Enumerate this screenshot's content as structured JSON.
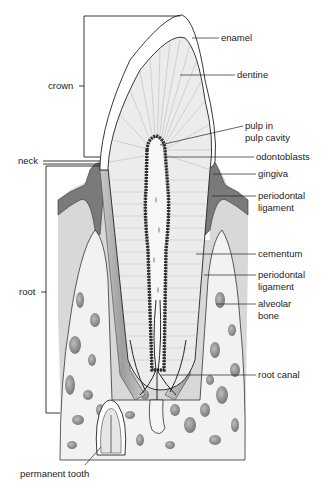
{
  "labels": {
    "enamel": "enamel",
    "dentine": "dentine",
    "pulp_line1": "pulp in",
    "pulp_line2": "pulp cavity",
    "odontoblasts": "odontoblasts",
    "gingiva": "gingiva",
    "pdl_upper_line1": "periodontal",
    "pdl_upper_line2": "ligament",
    "cementum": "cementum",
    "pdl_lower_line1": "periodontal",
    "pdl_lower_line2": "ligament",
    "alveolar_line1": "alveolar",
    "alveolar_line2": "bone",
    "root_canal": "root canal",
    "permanent_tooth": "permanent tooth",
    "crown": "crown",
    "neck": "neck",
    "root": "root"
  },
  "colors": {
    "background": "#ffffff",
    "outline": "#222222",
    "gingiva": "#7a7a7a",
    "bone_bg": "#f0f0f0",
    "tissue_bg": "#d6d6d6",
    "dentine": "#eaeaea",
    "pdl": "#bdbdbd",
    "bone_spots": "#8c8c8c"
  }
}
